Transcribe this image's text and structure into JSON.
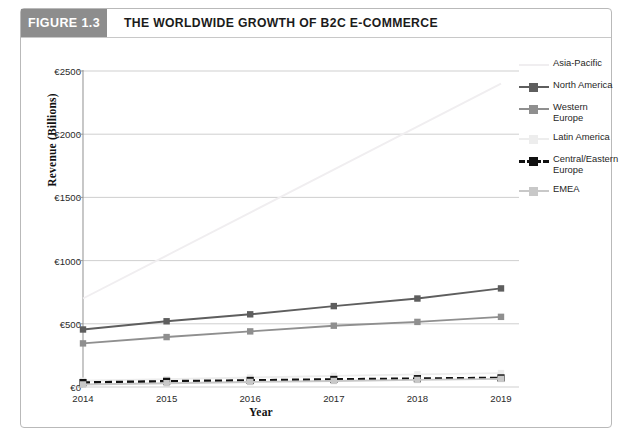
{
  "figure": {
    "number_label": "FIGURE 1.3",
    "title": "THE WORLDWIDE GROWTH OF B2C E-COMMERCE"
  },
  "colors": {
    "figure_band": "#8d8d8d",
    "card_border": "#b9b9b9",
    "grid": "#c9c9c9",
    "axis": "#9a9a9a",
    "asia_pacific": "#f0eef0",
    "north_america": "#5e5e5e",
    "western_europe": "#8f8f8f",
    "latin_america": "#ededed",
    "central_eastern_europe": "#111111",
    "emea": "#c8c8c8"
  },
  "chart_data": {
    "type": "line",
    "title": "THE WORLDWIDE GROWTH OF B2C E-COMMERCE",
    "xlabel": "Year",
    "ylabel": "Revenue (Billions)",
    "categories": [
      "2014",
      "2015",
      "2016",
      "2017",
      "2018",
      "2019"
    ],
    "x_tick_labels": [
      "2014",
      "2015",
      "2016",
      "2017",
      "2018",
      "2019"
    ],
    "y_tick_labels": [
      "€0",
      "€500",
      "€1000",
      "€1500",
      "€2000",
      "€2500"
    ],
    "y_tick_values": [
      0,
      500,
      1000,
      1500,
      2000,
      2500
    ],
    "ylim": [
      0,
      2500
    ],
    "grid": true,
    "legend_position": "right",
    "series": [
      {
        "name": "Asia-Pacific",
        "color": "#f0eef0",
        "marker": "none",
        "dashed": false,
        "values": [
          700,
          1040,
          1380,
          1720,
          2060,
          2400
        ]
      },
      {
        "name": "North America",
        "color": "#5e5e5e",
        "marker": "square",
        "dashed": false,
        "values": [
          455,
          520,
          575,
          640,
          700,
          780
        ]
      },
      {
        "name": "Western Europe",
        "color": "#8f8f8f",
        "marker": "square",
        "dashed": false,
        "values": [
          345,
          395,
          440,
          485,
          515,
          555
        ]
      },
      {
        "name": "Latin America",
        "color": "#ededed",
        "marker": "square",
        "dashed": false,
        "values": [
          50,
          62,
          75,
          88,
          100,
          110
        ]
      },
      {
        "name": "Central/Eastern\nEurope",
        "color": "#111111",
        "marker": "square",
        "dashed": true,
        "values": [
          35,
          45,
          52,
          60,
          66,
          72
        ]
      },
      {
        "name": "EMEA",
        "color": "#c8c8c8",
        "marker": "square",
        "dashed": false,
        "values": [
          20,
          30,
          40,
          48,
          56,
          64
        ]
      }
    ]
  },
  "legend": {
    "items": [
      {
        "label": "Asia-Pacific"
      },
      {
        "label": "North America"
      },
      {
        "label": "Western Europe"
      },
      {
        "label": "Latin America"
      },
      {
        "label": "Central/Eastern\nEurope"
      },
      {
        "label": "EMEA"
      }
    ]
  }
}
